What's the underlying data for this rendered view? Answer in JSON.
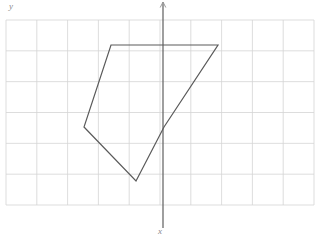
{
  "figure": {
    "title": "",
    "type": "geometry-plot",
    "canvas": {
      "width": 320,
      "height": 237,
      "background": "#ffffff"
    },
    "grid": {
      "visible": true,
      "color": "#d4d4d4",
      "line_width": 0.8,
      "origin_px": {
        "x": 6,
        "y": 20
      },
      "cell_size_px": 30.8,
      "columns": 10,
      "rows": 6,
      "right_px": 314,
      "bottom_px": 205
    },
    "axes": {
      "y_axis": {
        "label": "y",
        "visible": true,
        "color": "#6b6b6b",
        "line_width": 1.3,
        "x_px": 163,
        "y_top_px": 2,
        "y_bottom_px": 228,
        "arrow_top": true
      },
      "x_axis": {
        "label": "x",
        "visible": false,
        "color": "#6b6b6b"
      },
      "label_y_pos": {
        "x": 9,
        "y": 9
      },
      "label_x_pos": {
        "x": 158,
        "y": 234
      }
    },
    "polygon": {
      "name": "pentagon",
      "stroke": "#5a5a5a",
      "stroke_width": 1.2,
      "fill": "none",
      "closed": true,
      "vertex_count": 5,
      "vertices_px": [
        {
          "x": 111,
          "y": 45
        },
        {
          "x": 218,
          "y": 45
        },
        {
          "x": 164,
          "y": 127
        },
        {
          "x": 136,
          "y": 181
        },
        {
          "x": 84,
          "y": 127
        }
      ],
      "vertices_grid": [
        {
          "x": -1.7,
          "y": 2.7
        },
        {
          "x": 1.8,
          "y": 2.7
        },
        {
          "x": 0.0,
          "y": 0.0
        },
        {
          "x": -0.9,
          "y": -1.8
        },
        {
          "x": -2.6,
          "y": 0.0
        }
      ]
    }
  },
  "chart_data": {
    "type": "scatter",
    "title": "",
    "xlabel": "x",
    "ylabel": "y",
    "grid": true,
    "legend": null,
    "annotations": [],
    "series": [
      {
        "name": "pentagon",
        "closed": true,
        "x": [
          -1.7,
          1.8,
          0.0,
          -0.9,
          -2.6
        ],
        "y": [
          2.7,
          2.7,
          0.0,
          -1.8,
          0.0
        ]
      }
    ],
    "xlim": [
      -5.1,
      4.9
    ],
    "ylim": [
      -2.7,
      3.3
    ]
  }
}
